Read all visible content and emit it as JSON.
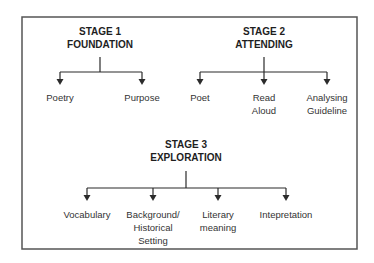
{
  "diagram": {
    "stages": [
      {
        "title_line1": "STAGE 1",
        "title_line2": "FOUNDATION",
        "children": [
          "Poetry",
          "Purpose"
        ]
      },
      {
        "title_line1": "STAGE 2",
        "title_line2": "ATTENDING",
        "children": [
          "Poet",
          "Read\nAloud",
          "Analysing\nGuideline"
        ]
      },
      {
        "title_line1": "STAGE 3",
        "title_line2": "EXPLORATION",
        "children": [
          "Vocabulary",
          "Background/\nHistorical\nSetting",
          "Literary\nmeaning",
          "Intepretation"
        ]
      }
    ],
    "colors": {
      "line": "#2b2b2b",
      "border": "#555555"
    }
  }
}
